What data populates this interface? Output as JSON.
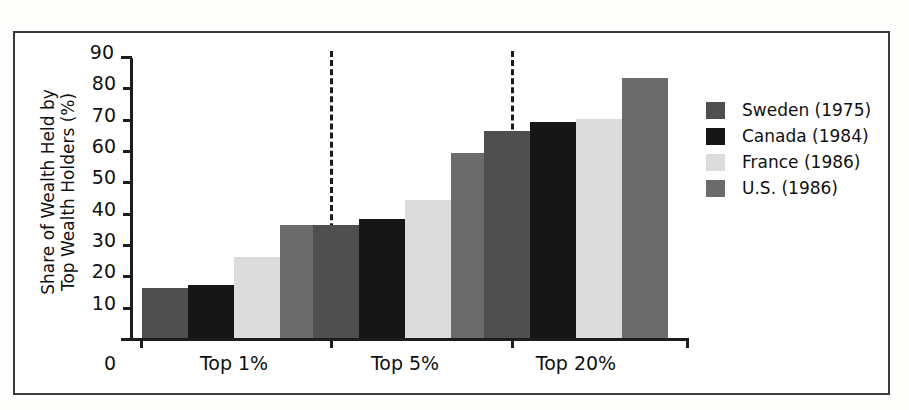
{
  "figure": {
    "background_color": "#ffffff",
    "frame_color": "#3a3a3a"
  },
  "axes": {
    "y_title_line1": "Share of Wealth Held by",
    "y_title_line2": "Top Wealth Holders (%)",
    "y_ticks": [
      "90",
      "80",
      "70",
      "60",
      "50",
      "40",
      "30",
      "20",
      "10"
    ],
    "zero_label": "0"
  },
  "legend": {
    "items": [
      {
        "label": "Sweden (1975)",
        "color": "#4f4f4f"
      },
      {
        "label": "Canada (1984)",
        "color": "#161616"
      },
      {
        "label": "France (1986)",
        "color": "#dcdcdc"
      },
      {
        "label": "U.S. (1986)",
        "color": "#6b6b6b"
      }
    ]
  },
  "chart_data": {
    "type": "bar",
    "title": "",
    "xlabel": "",
    "ylabel": "Share of Wealth Held by Top Wealth Holders (%)",
    "ylim": [
      0,
      90
    ],
    "ytick_step": 10,
    "grid": false,
    "legend_position": "right",
    "categories": [
      "Top 1%",
      "Top 5%",
      "Top 20%"
    ],
    "series": [
      {
        "name": "Sweden (1975)",
        "color": "#4f4f4f",
        "values": [
          16,
          36,
          66
        ]
      },
      {
        "name": "Canada (1984)",
        "color": "#161616",
        "values": [
          17,
          38,
          69
        ]
      },
      {
        "name": "France (1986)",
        "color": "#dcdcdc",
        "values": [
          26,
          44,
          70
        ]
      },
      {
        "name": "U.S. (1986)",
        "color": "#6b6b6b",
        "values": [
          36,
          59,
          83
        ]
      }
    ],
    "annotations": {
      "group_dividers": [
        "after Top 1%",
        "after Top 5%"
      ],
      "divider_style": "vertical dashed line"
    }
  }
}
